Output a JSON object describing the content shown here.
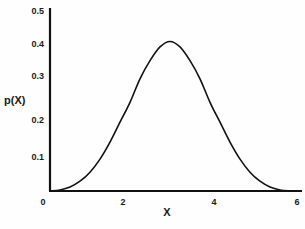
{
  "chart_data": {
    "type": "line",
    "title": "",
    "xlabel": "X",
    "ylabel": "p(X)",
    "xlim": [
      0,
      6
    ],
    "ylim": [
      0,
      0.5
    ],
    "x_ticks": [
      "0",
      "2",
      "4",
      "6"
    ],
    "y_ticks": [
      "0.1",
      "0.2",
      "0.3",
      "0.4",
      "0.5"
    ],
    "grid": false,
    "legend": null,
    "series": [
      {
        "name": "p(X)",
        "description": "bell-shaped density peaking at X=3 with p≈0.41",
        "x": [
          0,
          0.25,
          0.5,
          0.75,
          1.0,
          1.25,
          1.5,
          1.75,
          2.0,
          2.25,
          2.5,
          2.75,
          3.0,
          3.25,
          3.5,
          3.75,
          4.0,
          4.25,
          4.5,
          4.75,
          5.0,
          5.25,
          5.5,
          5.75,
          6.0
        ],
        "values": [
          0.0,
          0.003,
          0.011,
          0.027,
          0.052,
          0.088,
          0.135,
          0.19,
          0.245,
          0.31,
          0.36,
          0.398,
          0.413,
          0.398,
          0.36,
          0.31,
          0.245,
          0.19,
          0.135,
          0.088,
          0.052,
          0.027,
          0.011,
          0.003,
          0.0
        ]
      }
    ]
  }
}
